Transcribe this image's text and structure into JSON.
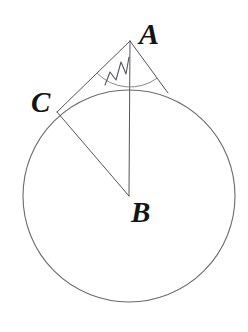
{
  "figure": {
    "kind": "circle-with-two-tangents-geometry-diagram",
    "background_color": "#ffffff",
    "stroke_color": "#55555a",
    "circle_stroke_color": "#6b6b70",
    "label_color": "#141414",
    "width": 248,
    "height": 332
  },
  "circle": {
    "name": "circle-B",
    "center_x": 129,
    "center_y": 196,
    "radius": 106,
    "stroke_width": 1.1
  },
  "points": {
    "A": {
      "label": "A",
      "x": 130,
      "y": 41,
      "role": "external-apex"
    },
    "B": {
      "label": "B",
      "x": 129,
      "y": 196,
      "role": "circle-center"
    },
    "C": {
      "label": "C",
      "x": 57,
      "y": 112,
      "role": "tangent-point-left"
    },
    "T": {
      "label": "",
      "x": 168,
      "y": 93,
      "role": "tangent-point-right"
    }
  },
  "segments": [
    {
      "name": "segment-AC",
      "from": "A",
      "to": "C",
      "stroke_width": 1.0
    },
    {
      "name": "segment-AB",
      "from": "A",
      "to": "B",
      "stroke_width": 1.0
    },
    {
      "name": "segment-AT",
      "from": "A",
      "to": "T",
      "stroke_width": 1.0
    },
    {
      "name": "segment-CB",
      "from": "C",
      "to": "B",
      "stroke_width": 1.0
    }
  ],
  "angle_marks": [
    {
      "name": "angle-arc-at-A",
      "vertex": "A",
      "radius": 46,
      "shape": "arc"
    },
    {
      "name": "angle-zigzag-hatch-at-A",
      "vertex": "A",
      "shape": "zigzag"
    }
  ],
  "labels": {
    "A": "A",
    "B": "B",
    "C": "C"
  }
}
